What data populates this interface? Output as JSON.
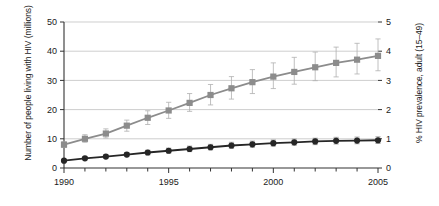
{
  "chart_data": {
    "type": "line",
    "title": "",
    "xlabel": "",
    "ylabel": "Number of people living with HIV (millions)",
    "ylabel_right": "% HIV prevalence, adult (15–49)",
    "grid": true,
    "legend": "none",
    "x": [
      1990,
      1991,
      1992,
      1993,
      1994,
      1995,
      1996,
      1997,
      1998,
      1999,
      2000,
      2001,
      2002,
      2003,
      2004,
      2005
    ],
    "xlim": [
      1990,
      2005
    ],
    "xticks": [
      1990,
      1995,
      2000,
      2005
    ],
    "xtick_labels": [
      "1990",
      "1995",
      "2000",
      "2005"
    ],
    "ylim": [
      0,
      50
    ],
    "yticks": [
      0,
      10,
      20,
      30,
      40,
      50
    ],
    "ytick_labels": [
      "0",
      "10",
      "20",
      "30",
      "40",
      "50"
    ],
    "ylim_right": [
      0,
      5
    ],
    "yticks_right": [
      0,
      1,
      2,
      3,
      4,
      5
    ],
    "ytick_labels_right": [
      "0",
      "1",
      "2",
      "3",
      "4",
      "5"
    ],
    "series": [
      {
        "name": "Number of people living with HIV (millions)",
        "axis": "left",
        "color": "#8c8c8c",
        "marker": "square",
        "values": [
          8.0,
          10.0,
          11.8,
          14.5,
          17.2,
          19.7,
          22.3,
          25.0,
          27.3,
          29.4,
          31.3,
          32.9,
          34.5,
          36.0,
          37.1,
          38.4
        ],
        "error_low": [
          7.0,
          8.8,
          10.3,
          12.6,
          14.9,
          17.0,
          19.4,
          21.6,
          23.6,
          25.5,
          27.2,
          28.7,
          29.9,
          31.2,
          32.2,
          33.3
        ],
        "error_high": [
          9.0,
          11.4,
          13.4,
          16.4,
          19.6,
          22.5,
          25.5,
          28.6,
          31.3,
          33.7,
          36.0,
          37.9,
          39.7,
          41.4,
          42.7,
          44.2
        ]
      },
      {
        "name": "% HIV prevalence, adult (15–49)",
        "axis": "right",
        "color": "#262626",
        "marker": "circle",
        "values": [
          0.25,
          0.33,
          0.39,
          0.46,
          0.53,
          0.59,
          0.65,
          0.71,
          0.77,
          0.81,
          0.85,
          0.88,
          0.91,
          0.93,
          0.94,
          0.95
        ],
        "error_low": [
          0.21,
          0.28,
          0.33,
          0.39,
          0.45,
          0.51,
          0.56,
          0.62,
          0.67,
          0.71,
          0.75,
          0.78,
          0.8,
          0.82,
          0.83,
          0.84
        ],
        "error_high": [
          0.29,
          0.38,
          0.45,
          0.53,
          0.61,
          0.68,
          0.75,
          0.81,
          0.88,
          0.92,
          0.96,
          0.99,
          1.02,
          1.05,
          1.06,
          1.07
        ]
      }
    ]
  }
}
